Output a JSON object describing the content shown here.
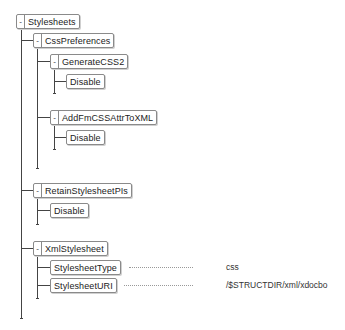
{
  "tree": {
    "root": {
      "label": "Stylesheets",
      "toggle": "-"
    },
    "css_preferences": {
      "label": "CssPreferences",
      "toggle": "-"
    },
    "generate_css2": {
      "label": "GenerateCSS2",
      "toggle": "-",
      "child": "Disable"
    },
    "add_fm_css": {
      "label": "AddFmCSSAttrToXML",
      "toggle": "-",
      "child": "Disable"
    },
    "retain_pis": {
      "label": "RetainStylesheetPIs",
      "toggle": "-",
      "child": "Disable"
    },
    "xml_stylesheet": {
      "label": "XmlStylesheet",
      "toggle": "-",
      "properties": [
        {
          "label": "StylesheetType",
          "value": "css"
        },
        {
          "label": "StylesheetURI",
          "value": "/$STRUCTDIR/xml/xdocbo"
        }
      ]
    }
  }
}
